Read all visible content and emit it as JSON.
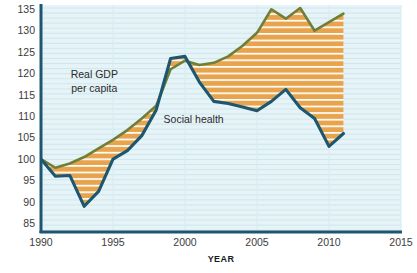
{
  "chart_data": {
    "type": "area",
    "title": "",
    "subtitle": "",
    "xlabel": "YEAR",
    "ylabel": "",
    "xlim": [
      1990,
      2015
    ],
    "ylim": [
      83,
      136
    ],
    "grid": true,
    "grid_orientation": "horizontal",
    "legend_position": "inline-annotations",
    "x_ticks": [
      1990,
      1995,
      2000,
      2005,
      2010,
      2015
    ],
    "y_ticks": [
      85,
      90,
      95,
      100,
      105,
      110,
      115,
      120,
      125,
      130,
      135
    ],
    "x": [
      1990,
      1991,
      1992,
      1993,
      1994,
      1995,
      1996,
      1997,
      1998,
      1999,
      2000,
      2001,
      2002,
      2003,
      2004,
      2005,
      2006,
      2007,
      2008,
      2009,
      2010,
      2011
    ],
    "series": [
      {
        "name": "Real GDP per capita",
        "color": "#6f7f38",
        "values": [
          100.0,
          98.0,
          99.0,
          100.5,
          102.5,
          104.5,
          106.8,
          109.5,
          112.5,
          121.0,
          123.0,
          122.0,
          122.5,
          124.0,
          126.5,
          129.5,
          135.0,
          132.8,
          135.3,
          130.0,
          132.0,
          134.0
        ]
      },
      {
        "name": "Social health",
        "color": "#1d5670",
        "values": [
          100.0,
          96.0,
          96.2,
          89.0,
          92.5,
          100.0,
          102.0,
          105.5,
          111.5,
          123.5,
          124.0,
          118.0,
          113.5,
          113.0,
          112.2,
          111.3,
          113.5,
          116.3,
          112.0,
          109.5,
          103.0,
          106.0
        ]
      }
    ],
    "annotations": [
      {
        "text": "Real GDP",
        "x": 1993.7,
        "y": 119.0
      },
      {
        "text": "per capita",
        "x": 1993.7,
        "y": 115.8
      },
      {
        "text": "Social health",
        "x": 2000.6,
        "y": 108.5
      }
    ],
    "fill": {
      "between": [
        "Real GDP per capita",
        "Social health"
      ],
      "color": "#e8a44c",
      "pattern": "horizontal-white-stripes"
    },
    "colors": {
      "plot_background": "#e6f3f7",
      "gridline": "#cfe6ee",
      "axis": "#1d5670",
      "gdp_line": "#6f7f38",
      "social_health_line": "#1d5670",
      "fill_orange": "#e8a44c",
      "page_background": "#ffffff",
      "tick_text": "#3b3b3b"
    }
  },
  "axes": {
    "x_axis_title": "YEAR",
    "x_tick_labels": [
      "1990",
      "1995",
      "2000",
      "2005",
      "2010",
      "2015"
    ],
    "y_tick_labels": [
      "135",
      "130",
      "125",
      "120",
      "115",
      "110",
      "105",
      "100",
      "95",
      "90",
      "85"
    ]
  },
  "labels": {
    "gdp_line1": "Real GDP",
    "gdp_line2": "per capita",
    "social_health": "Social health"
  }
}
